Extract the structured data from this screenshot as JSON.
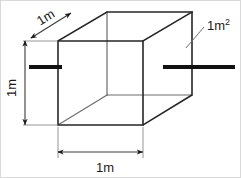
{
  "figure": {
    "background_color": "#ffffff",
    "edge_color": "#262626",
    "dimension_color": "#3a3a3a",
    "bar_color": "#111111",
    "labels": {
      "depth": "1m",
      "height": "1m",
      "width": "1m",
      "area_value": "1m",
      "area_exponent": "2",
      "area_full": "1m2"
    }
  },
  "geometry": {
    "front_face": {
      "left": 58,
      "top": 41,
      "right": 143,
      "bottom": 125
    },
    "depth_offset": {
      "dx": 49,
      "dy": -29
    },
    "back_face": {
      "left": 107,
      "top": 12,
      "right": 192,
      "bottom": 95
    },
    "dimension_lines": [
      {
        "name": "width",
        "x1": 58,
        "y1": 152,
        "x2": 143,
        "y2": 152
      },
      {
        "name": "height",
        "x1": 25,
        "y1": 41,
        "x2": 25,
        "y2": 125
      },
      {
        "name": "depth",
        "x1": 30,
        "y1": 38,
        "x2": 72,
        "y2": 12
      }
    ],
    "thick_bars": [
      {
        "name": "left-bar",
        "x1": 29,
        "y1": 67,
        "x2": 62,
        "y2": 67
      },
      {
        "name": "right-bar",
        "x1": 163,
        "y1": 67,
        "x2": 235,
        "y2": 67
      }
    ],
    "leader": {
      "x1": 186,
      "y1": 48,
      "x2": 205,
      "y2": 26
    }
  }
}
